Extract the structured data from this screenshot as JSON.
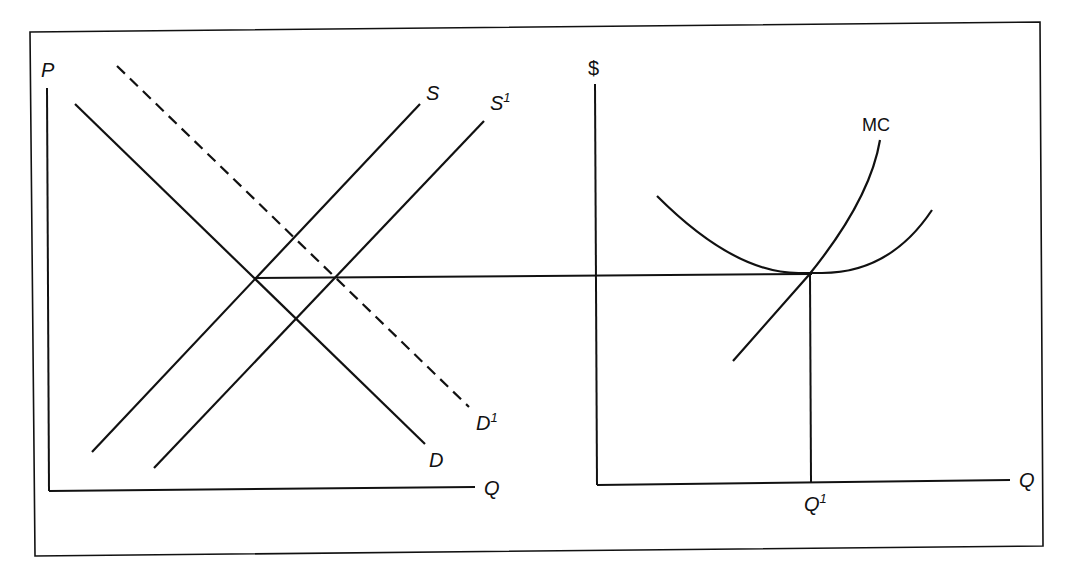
{
  "diagram": {
    "type": "economics-supply-demand-and-firm-cost",
    "left_panel": {
      "y_axis_label": "P",
      "x_axis_label": "Q",
      "curves": [
        {
          "name": "D",
          "label": "D",
          "style": "solid",
          "kind": "demand"
        },
        {
          "name": "D1",
          "label": "D",
          "superscript": "1",
          "style": "dashed",
          "kind": "demand-shifted"
        },
        {
          "name": "S",
          "label": "S",
          "style": "solid",
          "kind": "supply"
        },
        {
          "name": "S1",
          "label": "S",
          "superscript": "1",
          "style": "solid",
          "kind": "supply-shifted"
        }
      ]
    },
    "right_panel": {
      "y_axis_label": "$",
      "x_axis_label": "Q",
      "curves": [
        {
          "name": "MC",
          "label": "MC",
          "style": "solid",
          "kind": "marginal-cost"
        },
        {
          "name": "ATC",
          "label": "",
          "style": "solid",
          "kind": "u-shaped-average-cost"
        }
      ],
      "q_marker": {
        "label": "Q",
        "superscript": "1"
      }
    },
    "connector": "Horizontal price line from the original D/S equilibrium across to the minimum of the U-shaped cost curve where MC intersects it",
    "colors": {
      "line": "#111111",
      "background": "#ffffff"
    }
  }
}
